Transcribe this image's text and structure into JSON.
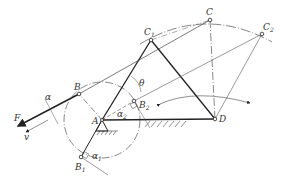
{
  "diagram": {
    "type": "four-bar crank-rocker linkage (pressure angle / transmission angle)",
    "colors": {
      "ink": "#222222",
      "thin": "#555555",
      "background": "#ffffff"
    },
    "labels": {
      "A": "A",
      "B": "B",
      "B1": "B",
      "B1_sub": "1",
      "B2": "B",
      "B2_sub": "2",
      "C": "C",
      "C1": "C",
      "C1_sub": "1",
      "C2": "C",
      "C2_sub": "2",
      "D": "D",
      "F": "F",
      "v": "v",
      "alpha": "α",
      "alpha1": "α",
      "alpha1_sub": "1",
      "alpha2": "α",
      "alpha2_sub": "2",
      "theta": "θ"
    },
    "points": {
      "A": [
        102,
        120
      ],
      "B": [
        79,
        94
      ],
      "B1": [
        81,
        157
      ],
      "B2": [
        134,
        101
      ],
      "C": [
        210,
        20
      ],
      "C1": [
        151,
        40
      ],
      "C2": [
        262,
        34
      ],
      "D": [
        215,
        119
      ]
    },
    "crank_circle": {
      "center": "A",
      "radius": 38
    },
    "rocker_arc": {
      "center": "D",
      "radius": 100
    }
  }
}
